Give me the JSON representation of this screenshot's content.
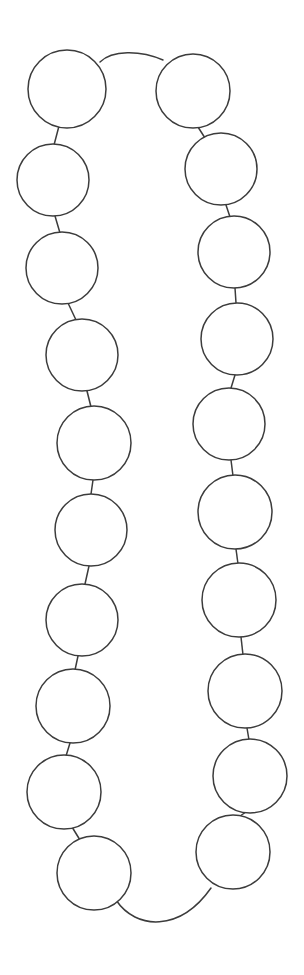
{
  "document": {
    "title": "Beaded Necklace Line Drawing",
    "type": "line-art-illustration",
    "subject": "necklace",
    "background_color": "#ffffff",
    "stroke_color": "#3c3c3c",
    "stroke_width": 1.5,
    "canvas": {
      "width": 304,
      "height": 975
    }
  },
  "drawing": {
    "bead_count": 20,
    "bead_radius": 36,
    "strand_label": "necklace-strand",
    "left_strand_label": "left-bead-column",
    "right_strand_label": "right-bead-column",
    "beads": [
      {
        "id": "bead-left-1",
        "side": "left",
        "index": 1,
        "cx": 67,
        "cy": 89,
        "r": 39
      },
      {
        "id": "bead-left-2",
        "side": "left",
        "index": 2,
        "cx": 53,
        "cy": 180,
        "r": 36
      },
      {
        "id": "bead-left-3",
        "side": "left",
        "index": 3,
        "cx": 62,
        "cy": 268,
        "r": 36
      },
      {
        "id": "bead-left-4",
        "side": "left",
        "index": 4,
        "cx": 82,
        "cy": 355,
        "r": 36
      },
      {
        "id": "bead-left-5",
        "side": "left",
        "index": 5,
        "cx": 94,
        "cy": 443,
        "r": 37
      },
      {
        "id": "bead-left-6",
        "side": "left",
        "index": 6,
        "cx": 91,
        "cy": 530,
        "r": 36
      },
      {
        "id": "bead-left-7",
        "side": "left",
        "index": 7,
        "cx": 82,
        "cy": 620,
        "r": 36
      },
      {
        "id": "bead-left-8",
        "side": "left",
        "index": 8,
        "cx": 73,
        "cy": 706,
        "r": 37
      },
      {
        "id": "bead-left-9",
        "side": "left",
        "index": 9,
        "cx": 64,
        "cy": 792,
        "r": 37
      },
      {
        "id": "bead-left-10",
        "side": "left",
        "index": 10,
        "cx": 94,
        "cy": 873,
        "r": 37
      },
      {
        "id": "bead-right-1",
        "side": "right",
        "index": 1,
        "cx": 193,
        "cy": 91,
        "r": 37
      },
      {
        "id": "bead-right-2",
        "side": "right",
        "index": 2,
        "cx": 221,
        "cy": 169,
        "r": 36
      },
      {
        "id": "bead-right-3",
        "side": "right",
        "index": 3,
        "cx": 234,
        "cy": 252,
        "r": 36
      },
      {
        "id": "bead-right-4",
        "side": "right",
        "index": 4,
        "cx": 237,
        "cy": 339,
        "r": 36
      },
      {
        "id": "bead-right-5",
        "side": "right",
        "index": 5,
        "cx": 229,
        "cy": 424,
        "r": 36
      },
      {
        "id": "bead-right-6",
        "side": "right",
        "index": 6,
        "cx": 235,
        "cy": 512,
        "r": 37
      },
      {
        "id": "bead-right-7",
        "side": "right",
        "index": 7,
        "cx": 239,
        "cy": 600,
        "r": 37
      },
      {
        "id": "bead-right-8",
        "side": "right",
        "index": 8,
        "cx": 245,
        "cy": 691,
        "r": 37
      },
      {
        "id": "bead-right-9",
        "side": "right",
        "index": 9,
        "cx": 250,
        "cy": 776,
        "r": 37
      },
      {
        "id": "bead-right-10",
        "side": "right",
        "index": 10,
        "cx": 233,
        "cy": 852,
        "r": 37
      }
    ],
    "links": [
      {
        "id": "link-left-1-2",
        "x1": 59,
        "y1": 126,
        "x2": 54,
        "y2": 145
      },
      {
        "id": "link-left-2-3",
        "x1": 55,
        "y1": 216,
        "x2": 60,
        "y2": 233
      },
      {
        "id": "link-left-3-4",
        "x1": 68,
        "y1": 303,
        "x2": 76,
        "y2": 320
      },
      {
        "id": "link-left-4-5",
        "x1": 87,
        "y1": 391,
        "x2": 91,
        "y2": 407
      },
      {
        "id": "link-left-5-6",
        "x1": 93,
        "y1": 480,
        "x2": 91,
        "y2": 494
      },
      {
        "id": "link-left-6-7",
        "x1": 89,
        "y1": 566,
        "x2": 85,
        "y2": 584
      },
      {
        "id": "link-left-7-8",
        "x1": 78,
        "y1": 656,
        "x2": 75,
        "y2": 670
      },
      {
        "id": "link-left-8-9",
        "x1": 70,
        "y1": 743,
        "x2": 66,
        "y2": 756
      },
      {
        "id": "link-left-9-10",
        "x1": 72,
        "y1": 827,
        "x2": 80,
        "y2": 840
      },
      {
        "id": "link-right-1-2",
        "x1": 198,
        "y1": 127,
        "x2": 205,
        "y2": 138
      },
      {
        "id": "link-right-2-3",
        "x1": 226,
        "y1": 205,
        "x2": 230,
        "y2": 217
      },
      {
        "id": "link-right-3-4",
        "x1": 235,
        "y1": 288,
        "x2": 236,
        "y2": 303
      },
      {
        "id": "link-right-4-5",
        "x1": 235,
        "y1": 375,
        "x2": 231,
        "y2": 388
      },
      {
        "id": "link-right-5-6",
        "x1": 231,
        "y1": 460,
        "x2": 233,
        "y2": 476
      },
      {
        "id": "link-right-6-7",
        "x1": 236,
        "y1": 549,
        "x2": 238,
        "y2": 564
      },
      {
        "id": "link-right-7-8",
        "x1": 241,
        "y1": 637,
        "x2": 243,
        "y2": 655
      },
      {
        "id": "link-right-8-9",
        "x1": 247,
        "y1": 728,
        "x2": 249,
        "y2": 740
      },
      {
        "id": "link-right-9-10",
        "x1": 246,
        "y1": 812,
        "x2": 240,
        "y2": 816
      }
    ],
    "arcs": [
      {
        "id": "arc-top-clasp",
        "label": "top-connecting-cord",
        "path": "M 100 62 C 112 50 140 50 163 60"
      },
      {
        "id": "arc-bottom-clasp",
        "label": "bottom-connecting-cord",
        "path": "M 116 900 C 136 930 180 932 211 888"
      }
    ]
  }
}
